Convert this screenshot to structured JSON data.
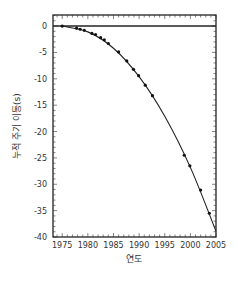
{
  "chart_data": {
    "type": "scatter",
    "title": "",
    "xlabel": "연도",
    "ylabel": "누적 주기 이동(s)",
    "xlim": [
      1974,
      2005
    ],
    "ylim": [
      -40,
      2
    ],
    "x_ticks": [
      1975,
      1980,
      1985,
      1990,
      1995,
      2000,
      2005
    ],
    "y_ticks": [
      0,
      -5,
      -10,
      -15,
      -20,
      -25,
      -30,
      -35,
      -40
    ],
    "grid": false,
    "legend": null,
    "series": [
      {
        "name": "observed",
        "marker": "dot",
        "x": [
          1975.0,
          1977.8,
          1978.5,
          1979.3,
          1980.8,
          1981.5,
          1982.5,
          1983.2,
          1984.0,
          1986.0,
          1987.6,
          1988.9,
          1989.9,
          1991.2,
          1992.6,
          1998.8,
          1999.9,
          2002.0,
          2003.7
        ],
        "y": [
          0.0,
          -0.4,
          -0.6,
          -0.8,
          -1.4,
          -1.6,
          -2.2,
          -2.6,
          -3.3,
          -4.9,
          -6.6,
          -8.2,
          -9.4,
          -11.2,
          -13.2,
          -24.5,
          -26.5,
          -31.1,
          -35.5
        ]
      },
      {
        "name": "prediction curve",
        "line": "solid",
        "x": [
          1975,
          1980,
          1985,
          1990,
          1995,
          2000,
          2005
        ],
        "y": [
          0.0,
          -1.1,
          -4.2,
          -9.6,
          -17.1,
          -26.8,
          -38.9
        ]
      },
      {
        "name": "zero line",
        "line": "solid",
        "x": [
          1974,
          2005
        ],
        "y": [
          0,
          0
        ]
      }
    ]
  }
}
